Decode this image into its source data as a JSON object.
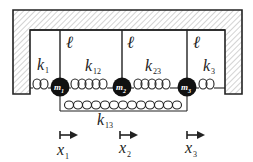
{
  "diagram": {
    "type": "coupled-oscillator-schematic",
    "masses": [
      {
        "id": "m1",
        "label": "m",
        "sub": "1",
        "cx": 60,
        "cy": 87
      },
      {
        "id": "m2",
        "label": "m",
        "sub": "2",
        "cx": 122,
        "cy": 87
      },
      {
        "id": "m3",
        "label": "m",
        "sub": "3",
        "cx": 187,
        "cy": 87
      }
    ],
    "springs": [
      {
        "id": "k1",
        "label": "k",
        "sub": "1",
        "from": "left-wall",
        "to": "m1"
      },
      {
        "id": "k12",
        "label": "k",
        "sub": "12",
        "from": "m1",
        "to": "m2"
      },
      {
        "id": "k23",
        "label": "k",
        "sub": "23",
        "from": "m2",
        "to": "m3"
      },
      {
        "id": "k3",
        "label": "k",
        "sub": "3",
        "from": "m3",
        "to": "right-wall"
      },
      {
        "id": "k13",
        "label": "k",
        "sub": "13",
        "from": "m1",
        "to": "m3"
      }
    ],
    "lengths": [
      {
        "label": "ℓ"
      },
      {
        "label": "ℓ"
      },
      {
        "label": "ℓ"
      }
    ],
    "displacements": [
      {
        "label": "x",
        "sub": "1"
      },
      {
        "label": "x",
        "sub": "2"
      },
      {
        "label": "x",
        "sub": "3"
      }
    ],
    "colors": {
      "stroke": "#222222",
      "mass_fill": "#111111",
      "hatch": "#9a9a9a"
    }
  }
}
